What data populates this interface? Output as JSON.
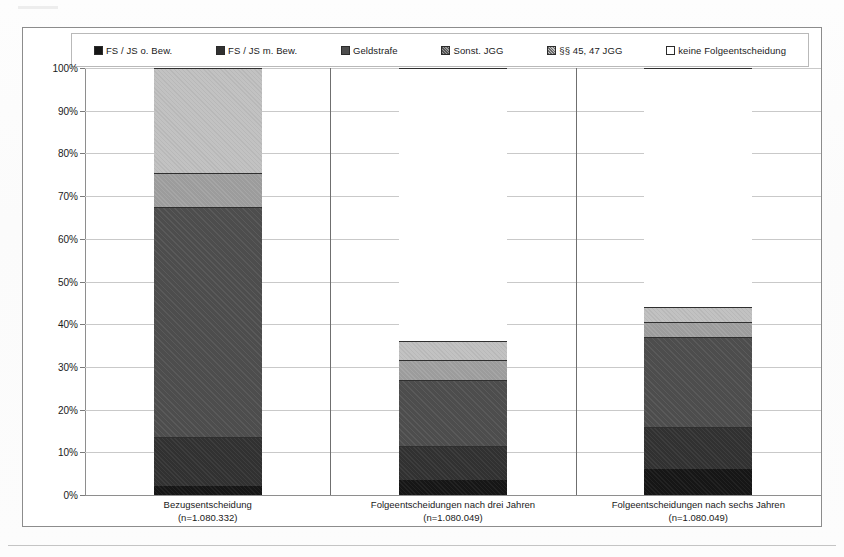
{
  "legend": {
    "items": [
      {
        "label": "FS / JS o. Bew.",
        "color": "#161616",
        "icon": "filled-square-icon"
      },
      {
        "label": "FS / JS m. Bew.",
        "color": "#313131",
        "icon": "filled-square-icon"
      },
      {
        "label": "Geldstrafe",
        "color": "#4d4d4d",
        "icon": "filled-square-icon"
      },
      {
        "label": "Sonst. JGG",
        "color": "#9c9c9c",
        "icon": "hatched-square-icon"
      },
      {
        "label": "§§ 45, 47 JGG",
        "color": "#c2c2c2",
        "icon": "hatched-square-icon"
      },
      {
        "label": "keine Folgeentscheidung",
        "color": "#ffffff",
        "icon": "empty-square-icon"
      }
    ]
  },
  "yaxis": {
    "ticks": [
      "100%",
      "90%",
      "80%",
      "70%",
      "60%",
      "50%",
      "40%",
      "30%",
      "20%",
      "10%",
      "0%"
    ],
    "min": 0,
    "max": 100
  },
  "xaxis": {
    "categories": [
      {
        "line1": "Bezugsentscheidung",
        "line2": "(n=1.080.332)"
      },
      {
        "line1": "Folgeentscheidungen nach drei Jahren",
        "line2": "(n=1.080.049)"
      },
      {
        "line1": "Folgeentscheidungen nach sechs Jahren",
        "line2": "(n=1.080.049)"
      }
    ]
  },
  "chart_data": {
    "type": "bar",
    "subtype": "stacked-100-percent",
    "title": "",
    "xlabel": "",
    "ylabel": "",
    "ylim": [
      0,
      100
    ],
    "grid": true,
    "legend_position": "top",
    "categories": [
      "Bezugsentscheidung (n=1.080.332)",
      "Folgeentscheidungen nach drei Jahren (n=1.080.049)",
      "Folgeentscheidungen nach sechs Jahren (n=1.080.049)"
    ],
    "series": [
      {
        "name": "FS / JS o. Bew.",
        "color": "#161616",
        "values": [
          2.0,
          3.5,
          6.0
        ]
      },
      {
        "name": "FS / JS m. Bew.",
        "color": "#313131",
        "values": [
          11.5,
          8.0,
          10.0
        ]
      },
      {
        "name": "Geldstrafe",
        "color": "#4d4d4d",
        "values": [
          54.0,
          15.5,
          21.0
        ]
      },
      {
        "name": "Sonst. JGG",
        "color": "#9c9c9c",
        "values": [
          8.0,
          4.5,
          3.5
        ]
      },
      {
        "name": "§§ 45, 47 JGG",
        "color": "#c2c2c2",
        "values": [
          24.5,
          4.5,
          3.5
        ]
      },
      {
        "name": "keine Folgeentscheidung",
        "color": "#ffffff",
        "values": [
          0.0,
          64.0,
          56.0
        ]
      }
    ],
    "stack_tops": [
      [
        2.0,
        13.5,
        67.5,
        75.5,
        100.0,
        100.0
      ],
      [
        3.5,
        11.5,
        27.0,
        31.5,
        36.0,
        100.0
      ],
      [
        6.0,
        16.0,
        37.0,
        40.5,
        44.0,
        100.0
      ]
    ]
  }
}
